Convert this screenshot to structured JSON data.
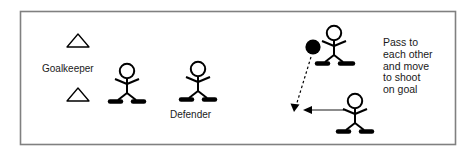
{
  "diagram": {
    "frame": {
      "x": 20,
      "y": 11,
      "width": 435,
      "height": 133,
      "stroke_color": "#808080"
    },
    "background_color": "#ffffff",
    "line_color": "#000000",
    "arrow_gray": "#8c8c8c",
    "labels": {
      "goalkeeper": "Goalkeeper",
      "defender": "Defender"
    },
    "instruction_lines": [
      "Pass to",
      "each other",
      "and move",
      "to shoot",
      "on goal"
    ],
    "cones": [
      {
        "name": "goal-cone-top",
        "cx": 78,
        "cy": 41,
        "half_width": 11,
        "height": 13
      },
      {
        "name": "goal-cone-bottom",
        "cx": 78,
        "cy": 95,
        "half_width": 11,
        "height": 13
      }
    ],
    "players": [
      {
        "name": "player-goalkeeper-side",
        "cx": 127,
        "cy": 82,
        "has_ball": false
      },
      {
        "name": "player-defender",
        "cx": 198,
        "cy": 80,
        "has_ball": false
      },
      {
        "name": "player-with-ball",
        "cx": 334,
        "cy": 46,
        "has_ball": true
      },
      {
        "name": "player-support",
        "cx": 355,
        "cy": 113,
        "has_ball": false
      }
    ],
    "ball": {
      "name": "ball",
      "cx": 313,
      "cy": 47,
      "r": 7.5,
      "color": "#000000"
    },
    "arrows": [
      {
        "name": "pass-arrow",
        "style": "dashed",
        "color": "#000000",
        "x1": 311,
        "y1": 56,
        "x2": 294,
        "y2": 110
      },
      {
        "name": "movement-arrow",
        "style": "solid",
        "color": "#8c8c8c",
        "x1": 342,
        "y1": 110,
        "x2": 304,
        "y2": 110
      }
    ]
  }
}
